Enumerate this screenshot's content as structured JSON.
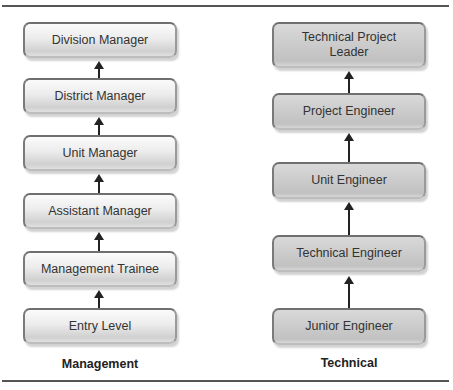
{
  "diagram": {
    "type": "career-ladder",
    "columns": [
      {
        "id": "management",
        "label": "Management",
        "levels_top_to_bottom": [
          "Division Manager",
          "District Manager",
          "Unit Manager",
          "Assistant Manager",
          "Management Trainee",
          "Entry Level"
        ]
      },
      {
        "id": "technical",
        "label": "Technical",
        "levels_top_to_bottom": [
          "Technical Project Leader",
          "Project Engineer",
          "Unit Engineer",
          "Technical Engineer",
          "Junior Engineer"
        ]
      }
    ],
    "edges": [
      {
        "from": "Entry Level",
        "to": "Management Trainee"
      },
      {
        "from": "Management Trainee",
        "to": "Assistant Manager"
      },
      {
        "from": "Assistant Manager",
        "to": "Unit Manager"
      },
      {
        "from": "Unit Manager",
        "to": "District Manager"
      },
      {
        "from": "District Manager",
        "to": "Division Manager"
      },
      {
        "from": "Junior Engineer",
        "to": "Technical Engineer"
      },
      {
        "from": "Technical Engineer",
        "to": "Unit Engineer"
      },
      {
        "from": "Unit Engineer",
        "to": "Project Engineer"
      },
      {
        "from": "Project Engineer",
        "to": "Technical Project Leader"
      }
    ]
  },
  "management": {
    "label": "Management",
    "boxes": [
      "Division Manager",
      "District Manager",
      "Unit Manager",
      "Assistant Manager",
      "Management Trainee",
      "Entry Level"
    ]
  },
  "technical": {
    "label": "Technical",
    "boxes": [
      "Technical Project Leader",
      "Project Engineer",
      "Unit Engineer",
      "Technical Engineer",
      "Junior Engineer"
    ]
  },
  "colors": {
    "rule": "#555555",
    "arrow": "#222222",
    "management_box_top": "#fbfbfb",
    "management_box_bottom": "#d0d0d0",
    "technical_box": "#cbcbcb",
    "box_border": "#6f6f6f",
    "text": "#333333"
  }
}
